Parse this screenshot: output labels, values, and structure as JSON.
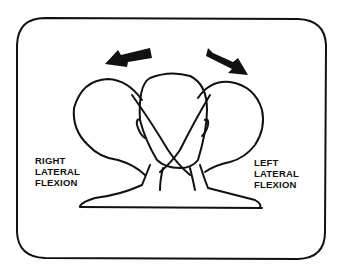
{
  "figure": {
    "labels": {
      "right": [
        "RIGHT",
        "LATERAL",
        "FLEXION"
      ],
      "left": [
        "LEFT",
        "LATERAL",
        "FLEXION"
      ]
    },
    "arrows": [
      {
        "name": "arrow-left",
        "direction": "up-left"
      },
      {
        "name": "arrow-right",
        "direction": "down-right"
      }
    ],
    "colors": {
      "ink": "#111111",
      "background": "#ffffff"
    }
  }
}
